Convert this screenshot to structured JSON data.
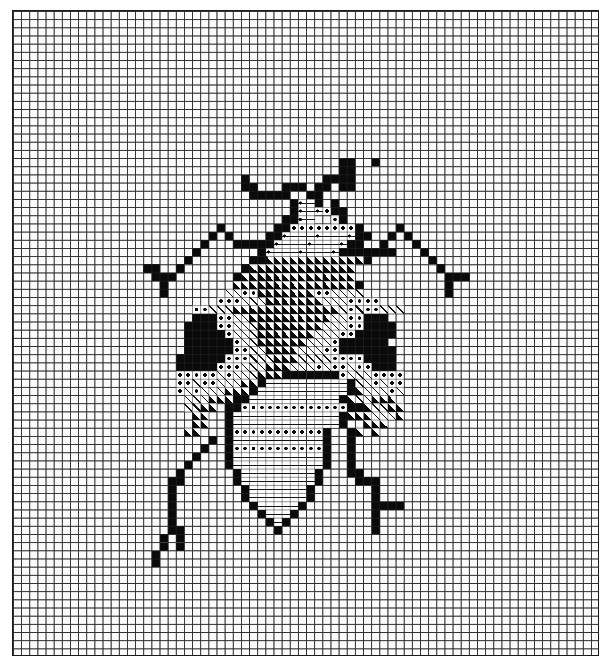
{
  "chart": {
    "title": "",
    "grid": {
      "cols": 72,
      "rows": 79
    },
    "legend": {
      ".": "empty",
      "#": "solid black",
      "t": "half triangle",
      "/": "diagonal hatch",
      "o": "dot",
      "-": "horizontal dash",
      "d": "dot with dash"
    },
    "pattern_origin": {
      "col": 15,
      "row": 18
    },
    "pattern_rows": [
      ".........................##..#...........",
      ".........................##..............",
      ".............#.........####..............",
      ".............##...###.##.##..............",
      "..............#####..##..................",
      "...................#d-#.#................",
      "...................#d-do##...............",
      "..................##d-..o#...............",
      "..........#......##oooooooo#....#........",
      ".........#.#....##d---d---d##..#.#.......",
      "........#...#####d---d---d##..#...#......",
      ".......#.......#d---d---d#######...#.....",
      "......#.......##tttttttttttt#.......#....",
      ".##..#.......#ttttttttttttt..........#...",
      "..###.......#tttttttttttttt...........###",
      "...#........ttttttttttttttt#..........#..",
      "...#.......//ootttttttoo////..........#..",
      "..........ooo///ttttttt///oooo...........",
      ".......oo///ttttttttttttt/o/oo///........",
      ".......###oo//tttttttttt//oo###..........",
      "......####oo///tttttttt///oo####.........",
      "......#####o///ttttttt///oo#####.........",
      "......######o//tttttt///o######..........",
      "......######oo//tttt///oo#######.........",
      ".....######ooo///ttt////oooo####.........",
      ".....#####ooo///ttt///o/oo/oo###.........",
      ".....ooooo/o///ttt#######o///oooo........",
      ".....oo/oo///tt#----------#//o/oo........",
      ".....o/o///ttt#-----------#t///o/........",
      "......///ttt##-----------#t//ttt.........",
      "......//tt.##ooooooooooooo##t//tt........",
      ".......tt..#-------------#ttt///t........",
      ".......tt..#-------------#..ttt..........",
      "......tt...#ooooooooooo#..#t.t...........",
      ".........#.#-----------#..#..............",
      "........#..#ooooooooooo#..#..............",
      ".......#...#-----------#..#..............",
      "......#....#-----------#..#..............",
      ".....#......#---------#...##.............",
      "....##......#---------#....###...........",
      "....#........#-------#.......#...........",
      "....#........#-------#.......#...........",
      "....#.........#-----#........####........",
      "....#..........#---#.........#...........",
      "....#...........#-#..........#...........",
      "....##...........#...........#...........",
      "...#.#...................................",
      "...#.#...................................",
      "..#......................................",
      "..#......................................"
    ],
    "cell_size_px": {
      "w": 8.153,
      "h": 8.177
    },
    "colors": {
      "ink": "#0a0a0a",
      "paper": "#ffffff",
      "grid": "#3a3a3a"
    }
  }
}
